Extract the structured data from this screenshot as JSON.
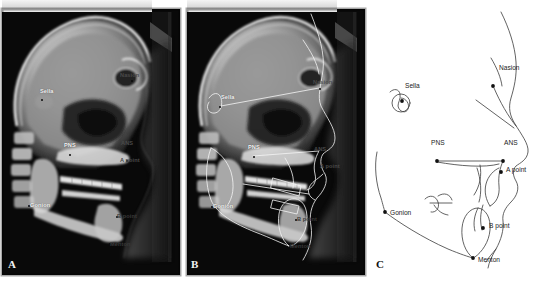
{
  "figure": {
    "background_color": "#ffffff",
    "panel_count": 3
  },
  "panels": [
    {
      "id": "a",
      "letter": "A",
      "type": "lateral-cephalometric-radiograph",
      "description": "Lateral cephalometric radiograph with landmark labels",
      "background_color": "#0a0a0a",
      "labels": [
        {
          "text": "Sella",
          "x": 40,
          "y": 88,
          "tone": "bright",
          "dot_x": 41,
          "dot_y": 99
        },
        {
          "text": "Nasion",
          "x": 120,
          "y": 72,
          "tone": "dim",
          "dot_x": 131,
          "dot_y": 80
        },
        {
          "text": "PNS",
          "x": 64,
          "y": 142,
          "tone": "bright",
          "dot_x": 69,
          "dot_y": 154
        },
        {
          "text": "ANS",
          "x": 121,
          "y": 140,
          "tone": "dim",
          "dot_x": 127,
          "dot_y": 150
        },
        {
          "text": "A point",
          "x": 120,
          "y": 157,
          "tone": "dim",
          "dot_x": 126,
          "dot_y": 160
        },
        {
          "text": "Gonion",
          "x": 30,
          "y": 202,
          "tone": "bright",
          "dot_x": 28,
          "dot_y": 205
        },
        {
          "text": "B point",
          "x": 117,
          "y": 213,
          "tone": "dimmer",
          "dot_x": 116,
          "dot_y": 216
        },
        {
          "text": "Menton",
          "x": 110,
          "y": 241,
          "tone": "dimmer",
          "dot_x": 109,
          "dot_y": 243
        }
      ]
    },
    {
      "id": "b",
      "letter": "B",
      "type": "lateral-cephalometric-radiograph-with-tracing",
      "description": "Same radiograph with acetate tracing overlay of skeletal and soft-tissue outlines",
      "background_color": "#0a0a0a",
      "labels": [
        {
          "text": "Sella",
          "x": 36,
          "y": 94,
          "tone": "bright",
          "dot_x": 34,
          "dot_y": 106
        },
        {
          "text": "Nasion",
          "x": 128,
          "y": 79,
          "tone": "dim",
          "dot_x": 134,
          "dot_y": 88
        },
        {
          "text": "PNS",
          "x": 63,
          "y": 144,
          "tone": "bright",
          "dot_x": 68,
          "dot_y": 156
        },
        {
          "text": "ANS",
          "x": 129,
          "y": 146,
          "tone": "dim",
          "dot_x": 134,
          "dot_y": 151
        },
        {
          "text": "A point",
          "x": 135,
          "y": 163,
          "tone": "dim",
          "dot_x": 133,
          "dot_y": 166
        },
        {
          "text": "Gonion",
          "x": 28,
          "y": 203,
          "tone": "bright",
          "dot_x": 26,
          "dot_y": 206
        },
        {
          "text": "B point",
          "x": 112,
          "y": 216,
          "tone": "dimmer",
          "dot_x": 110,
          "dot_y": 219
        },
        {
          "text": "Menton",
          "x": 105,
          "y": 243,
          "tone": "dimmer",
          "dot_x": 104,
          "dot_y": 245
        }
      ]
    },
    {
      "id": "c",
      "letter": "C",
      "type": "cephalometric-tracing-line-drawing",
      "description": "Clean line-drawing tracing of the cephalometric landmarks",
      "background_color": "#ffffff",
      "line_color": "#3b3b3b",
      "landmarks": [
        {
          "name": "Sella",
          "label": "Sella",
          "dot_x": 34,
          "dot_y": 101,
          "label_x": 37,
          "label_y": 88
        },
        {
          "name": "Nasion",
          "label": "Nasion",
          "dot_x": 125,
          "dot_y": 86,
          "label_x": 131,
          "label_y": 71
        },
        {
          "name": "PNS",
          "label": "PNS",
          "dot_x": 69,
          "dot_y": 161,
          "label_x": 63,
          "label_y": 145
        },
        {
          "name": "ANS",
          "label": "ANS",
          "dot_x": 135,
          "dot_y": 161,
          "label_x": 136,
          "label_y": 145
        },
        {
          "name": "A point",
          "label": "A point",
          "dot_x": 133,
          "dot_y": 172,
          "label_x": 138,
          "label_y": 168
        },
        {
          "name": "Gonion",
          "label": "Gonion",
          "dot_x": 17,
          "dot_y": 212,
          "label_x": 22,
          "label_y": 213
        },
        {
          "name": "B point",
          "label": "B point",
          "dot_x": 115,
          "dot_y": 228,
          "label_x": 121,
          "label_y": 225
        },
        {
          "name": "Menton",
          "label": "Menton",
          "dot_x": 105,
          "dot_y": 258,
          "label_x": 110,
          "label_y": 260
        }
      ]
    }
  ]
}
